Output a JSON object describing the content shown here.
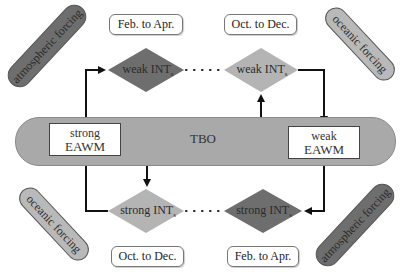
{
  "diagram": {
    "center_bar": {
      "label": "TBO",
      "color": "#a9a9a9"
    },
    "eawm_boxes": [
      {
        "id": "strong",
        "line1": "strong",
        "line2": "EAWM"
      },
      {
        "id": "weak",
        "line1": "weak",
        "line2": "EAWM"
      }
    ],
    "diamonds": {
      "top_left": {
        "label": "weak INT",
        "sub": "s",
        "color": "#6e6e6e"
      },
      "top_right": {
        "label": "weak INT",
        "sub": "s",
        "color": "#b4b4b4"
      },
      "bottom_left": {
        "label": "strong INT",
        "sub": "s",
        "color": "#b4b4b4"
      },
      "bottom_right": {
        "label": "strong INT",
        "sub": "s",
        "color": "#6e6e6e"
      }
    },
    "seasons": {
      "top_left": "Feb. to Apr.",
      "top_right": "Oct. to Dec.",
      "bottom_left": "Oct. to Dec.",
      "bottom_right": "Feb. to Apr."
    },
    "forcings": {
      "top_left": {
        "label": "atmospheric forcing",
        "color": "#6e6e6e"
      },
      "top_right": {
        "label": "oceanic forcing",
        "color": "#b9b9b9"
      },
      "bottom_left": {
        "label": "oceanic forcing",
        "color": "#b9b9b9"
      },
      "bottom_right": {
        "label": "atmospheric forcing",
        "color": "#6e6e6e"
      }
    }
  }
}
